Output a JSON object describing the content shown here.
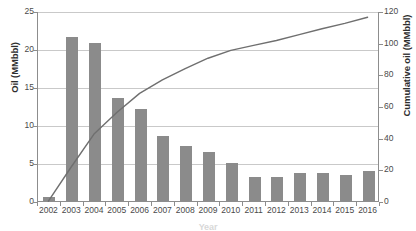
{
  "chart_data": {
    "type": "bar",
    "title": "",
    "subtitle": "",
    "xlabel": "Year",
    "ylabel": "Oil (MMbbl)",
    "y2label": "Cumulative oil (MMbbl)",
    "categories": [
      "2002",
      "2003",
      "2004",
      "2005",
      "2006",
      "2007",
      "2008",
      "2009",
      "2010",
      "2011",
      "2012",
      "2013",
      "2014",
      "2015",
      "2016"
    ],
    "values": [
      0.5,
      21.6,
      20.8,
      13.6,
      12.1,
      8.5,
      7.2,
      6.5,
      5.0,
      3.1,
      3.1,
      3.7,
      3.7,
      3.4,
      3.9
    ],
    "ylim": [
      0,
      25
    ],
    "yticks": [
      "0",
      "5",
      "10",
      "15",
      "20",
      "25"
    ],
    "y2lim": [
      0,
      120
    ],
    "y2ticks": [
      "0",
      "20",
      "40",
      "60",
      "80",
      "100",
      "120"
    ],
    "grid": true,
    "legend": "none",
    "series": [
      {
        "name": "Oil (MMbbl)",
        "type": "bar",
        "axis": "left",
        "color": "#8b8b8b",
        "values": [
          0.5,
          21.6,
          20.8,
          13.6,
          12.1,
          8.5,
          7.2,
          6.5,
          5.0,
          3.1,
          3.1,
          3.7,
          3.7,
          3.4,
          3.9
        ]
      },
      {
        "name": "Cumulative oil (MMbbl)",
        "type": "line",
        "axis": "right",
        "color": "#6f6f6f",
        "values": [
          0.5,
          22.1,
          42.9,
          56.5,
          68.6,
          77.1,
          84.3,
          90.8,
          95.8,
          98.9,
          102.0,
          105.7,
          109.4,
          112.8,
          116.7
        ]
      }
    ]
  },
  "axes": {
    "left_title": "Oil (MMbbl)",
    "right_title": "Cumulative oil (MMbbl)",
    "bottom_title": "Year"
  }
}
